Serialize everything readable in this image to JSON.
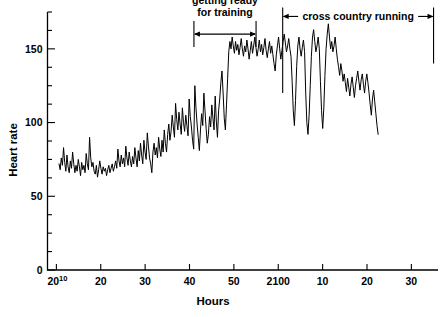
{
  "chart_data": {
    "type": "line",
    "title": "",
    "xlabel": "Hours",
    "ylabel": "Heart rate",
    "ylim": [
      0,
      175
    ],
    "yticks_major": [
      0,
      50,
      100,
      150
    ],
    "yticks_minor_step": 12.5,
    "grid": false,
    "legend": null,
    "xtick_labels": [
      "20",
      "20",
      "30",
      "40",
      "50",
      "2100",
      "10",
      "20",
      "30"
    ],
    "xtick_superscripts": [
      "10",
      "",
      "",
      "",
      "",
      "",
      "",
      "",
      ""
    ],
    "xtick_values": [
      0,
      10,
      20,
      30,
      40,
      50,
      60,
      70,
      80
    ],
    "xlim": [
      -2,
      86
    ],
    "annotations": [
      {
        "label_line1": "getting ready",
        "label_line2": "for training",
        "type": "double-arrow-bracket",
        "x_start": 31,
        "x_end": 45,
        "y_value": 160
      },
      {
        "label": "cross country running",
        "type": "double-arrow-span",
        "x_start": 51,
        "x_end": 85,
        "y_value": 172
      }
    ],
    "dividers": [
      {
        "x": 51,
        "y_top": 178,
        "y_bottom": 120
      },
      {
        "x": 85,
        "y_top": 178,
        "y_bottom": 140
      }
    ],
    "series": [
      {
        "name": "Heart rate",
        "units": "beats per minute",
        "x_start": 0.6,
        "x_step": 0.255,
        "values": [
          72,
          68,
          76,
          71,
          83,
          73,
          67,
          78,
          70,
          66,
          74,
          69,
          80,
          72,
          66,
          71,
          67,
          75,
          70,
          64,
          73,
          68,
          71,
          66,
          79,
          72,
          68,
          90,
          76,
          70,
          73,
          67,
          65,
          71,
          63,
          68,
          74,
          69,
          65,
          70,
          67,
          69,
          64,
          68,
          71,
          66,
          69,
          72,
          67,
          70,
          74,
          69,
          82,
          74,
          70,
          78,
          72,
          76,
          70,
          84,
          76,
          71,
          80,
          74,
          70,
          77,
          72,
          83,
          76,
          70,
          81,
          74,
          86,
          78,
          72,
          88,
          80,
          75,
          93,
          84,
          76,
          72,
          66,
          80,
          86,
          78,
          83,
          76,
          90,
          82,
          77,
          88,
          80,
          95,
          86,
          80,
          92,
          99,
          88,
          94,
          105,
          97,
          90,
          113,
          102,
          95,
          107,
          99,
          92,
          110,
          100,
          94,
          105,
          98,
          91,
          116,
          104,
          97,
          88,
          82,
          125,
          110,
          99,
          90,
          81,
          95,
          106,
          98,
          120,
          108,
          96,
          86,
          92,
          104,
          97,
          112,
          103,
          95,
          118,
          101,
          90,
          108,
          116,
          127,
          135,
          120,
          103,
          95,
          112,
          130,
          148,
          155,
          150,
          158,
          152,
          147,
          155,
          149,
          153,
          146,
          151,
          157,
          150,
          145,
          152,
          148,
          156,
          150,
          143,
          149,
          155,
          147,
          152,
          158,
          151,
          145,
          150,
          156,
          148,
          153,
          146,
          151,
          157,
          149,
          144,
          150,
          155,
          147,
          152,
          146,
          140,
          135,
          146,
          152,
          158,
          150,
          143,
          149,
          155,
          160,
          154,
          148,
          152,
          157,
          150,
          145,
          128,
          108,
          98,
          115,
          138,
          152,
          158,
          150,
          145,
          151,
          156,
          148,
          120,
          100,
          92,
          105,
          125,
          145,
          158,
          163,
          155,
          148,
          152,
          158,
          150,
          128,
          108,
          96,
          110,
          132,
          150,
          160,
          167,
          158,
          150,
          155,
          148,
          152,
          158,
          150,
          143,
          138,
          132,
          140,
          135,
          128,
          133,
          127,
          121,
          130,
          124,
          118,
          126,
          131,
          124,
          117,
          125,
          130,
          135,
          128,
          122,
          129,
          133,
          126,
          120,
          128,
          133,
          127,
          120,
          112,
          105,
          116,
          122,
          114,
          106,
          98,
          92
        ]
      }
    ]
  }
}
